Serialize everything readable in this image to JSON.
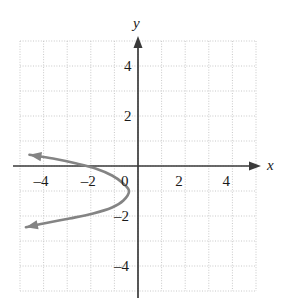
{
  "chart_data": {
    "type": "line",
    "title": "",
    "subtitle": "",
    "xlabel": "x",
    "ylabel": "y",
    "xlim": [
      -5,
      5
    ],
    "ylim": [
      -5,
      5
    ],
    "grid": true,
    "grid_step": 1,
    "legend": "none",
    "x_ticks": [
      -4,
      -2,
      0,
      2,
      4
    ],
    "x_tick_labels": [
      "–4",
      "–2",
      "0",
      "2",
      "4"
    ],
    "y_ticks": [
      4,
      2,
      -2,
      -4
    ],
    "y_tick_labels": [
      "4",
      "2",
      "–2",
      "–4"
    ],
    "origin_label": "0",
    "axis_arrows": [
      "x-positive",
      "y-positive"
    ],
    "series": [
      {
        "name": "leftward-opening parabola",
        "curve_type": "parabola",
        "opens": "left",
        "vertex": [
          -0.3,
          -1.0
        ],
        "arrowheads": [
          "upper-left-end",
          "lower-left-end"
        ],
        "points": [
          [
            -4.6,
            0.45
          ],
          [
            -3.6,
            0.3
          ],
          [
            -2.6,
            0.1
          ],
          [
            -1.8,
            -0.1
          ],
          [
            -1.1,
            -0.38
          ],
          [
            -0.65,
            -0.68
          ],
          [
            -0.38,
            -1.0
          ],
          [
            -0.62,
            -1.38
          ],
          [
            -1.1,
            -1.66
          ],
          [
            -1.9,
            -1.9
          ],
          [
            -2.9,
            -2.1
          ],
          [
            -4.0,
            -2.3
          ],
          [
            -4.75,
            -2.45
          ]
        ]
      }
    ]
  },
  "labels": {
    "x_axis": "x",
    "y_axis": "y"
  },
  "colors": {
    "axis": "#3a3a3a",
    "grid": "#c8c8c8",
    "curve": "#848484",
    "text": "#1a1a1a",
    "background": "#ffffff"
  }
}
